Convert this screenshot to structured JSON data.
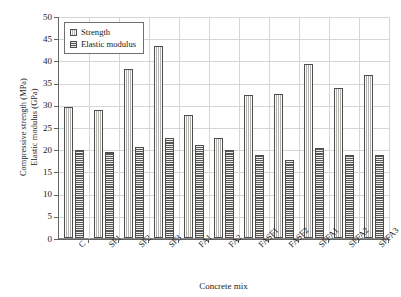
{
  "chart_data": {
    "type": "bar",
    "title": "",
    "xlabel": "Concrete mix",
    "ylabel_line1": "Compressive strength (MPa)",
    "ylabel_line2": "Elastic modulus (GPa)",
    "categories": [
      "C",
      "SF1",
      "SF2",
      "SF3",
      "FA1",
      "FA2",
      "FASF1",
      "FASF2",
      "SFFA1",
      "SFFA2",
      "SFFA3"
    ],
    "series": [
      {
        "name": "Strength",
        "unit": "MPa",
        "values": [
          29.4,
          28.9,
          38.0,
          43.2,
          27.8,
          22.5,
          32.3,
          32.5,
          39.1,
          33.8,
          36.8
        ]
      },
      {
        "name": "Elastic modulus",
        "unit": "GPa",
        "values": [
          19.9,
          19.3,
          20.4,
          22.5,
          20.9,
          19.9,
          18.7,
          17.6,
          20.3,
          18.8,
          18.7
        ]
      }
    ],
    "ylim": [
      0,
      50
    ],
    "yticks": [
      0,
      5,
      10,
      15,
      20,
      25,
      30,
      35,
      40,
      45,
      50
    ],
    "ytick_labels": [
      "0",
      "5",
      "10",
      "15",
      "20",
      "25",
      "30",
      "35",
      "40",
      "45",
      "50"
    ],
    "grid": true,
    "legend_position": "upper left",
    "legend_entries": [
      "Strength",
      "Elastic modulus"
    ],
    "colors": {
      "strength_fill": "#d8d6d2",
      "modulus_fill": "#8f8d88",
      "bar_edge": "#4d4d4d",
      "grid": "#d6d6d6",
      "axis": "#636363",
      "text": "#1a1a1a",
      "background": "#ffffff"
    }
  }
}
